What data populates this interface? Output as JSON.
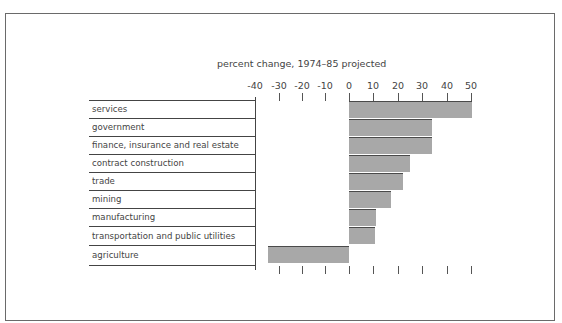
{
  "chart_data": {
    "type": "bar",
    "orientation": "horizontal",
    "title": "percent change, 1974–85 projected",
    "xlabel": "",
    "ylabel": "",
    "xlim": [
      -40,
      50
    ],
    "x_ticks": [
      -40,
      -30,
      -20,
      -10,
      0,
      10,
      20,
      30,
      40,
      50
    ],
    "grid": false,
    "legend": null,
    "categories": [
      "services",
      "government",
      "finance, insurance and real estate",
      "contract construction",
      "trade",
      "mining",
      "manufacturing",
      "transportation and public utilities",
      "agriculture"
    ],
    "values": [
      50,
      34,
      34,
      25,
      22,
      17,
      11,
      10.5,
      -33
    ],
    "bar_color": "#a8a8a8"
  },
  "title": "percent change, 1974–85 projected",
  "ticks": [
    "-40",
    "-30",
    "-20",
    "-10",
    "0",
    "10",
    "20",
    "30",
    "40",
    "50"
  ],
  "labels": [
    "services",
    "government",
    "finance, insurance and real estate",
    "contract construction",
    "trade",
    "mining",
    "manufacturing",
    "transportation and public utilities",
    "agriculture"
  ]
}
